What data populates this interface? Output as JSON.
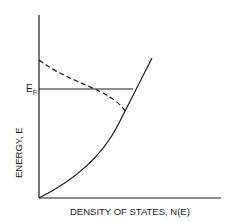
{
  "diagram": {
    "title": "",
    "x_axis_label": "DENSITY OF STATES, N(E)",
    "y_axis_label": "ENERGY, E",
    "fermi_label": "E",
    "fermi_subscript": "F",
    "curves": [
      {
        "name": "density-of-states",
        "style": "solid",
        "shape": "parabolic N(E) ~ sqrt(E)"
      },
      {
        "name": "occupied-states",
        "style": "dashed",
        "shape": "Fermi-Dirac weighted"
      }
    ],
    "fermi_level_line": {
      "style": "solid",
      "orientation": "horizontal"
    },
    "colors": {
      "line": "#1a1a1a",
      "background": "#ffffff"
    }
  }
}
